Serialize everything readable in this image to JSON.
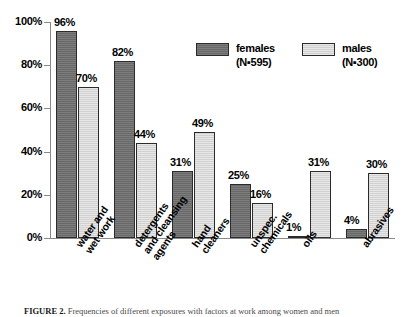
{
  "chart_data": {
    "type": "bar",
    "title": "",
    "xlabel": "",
    "ylabel": "",
    "ylim": [
      0,
      100
    ],
    "yticks": [
      0,
      20,
      40,
      60,
      80,
      100
    ],
    "ytick_labels": [
      "0%",
      "20%",
      "40%",
      "60%",
      "80%",
      "100%"
    ],
    "grid": false,
    "legend_position": "top-right",
    "categories": [
      "water and wet work",
      "detergents and cleansing agents",
      "hand cleaners",
      "unspec. chemicals",
      "oils",
      "abrasives"
    ],
    "category_lines": [
      [
        "water and",
        "wet work"
      ],
      [
        "detergents",
        "and cleansing",
        "agents"
      ],
      [
        "hand",
        "cleaners"
      ],
      [
        "unspec.",
        "chemicals"
      ],
      [
        "oils"
      ],
      [
        "abrasives"
      ]
    ],
    "series": [
      {
        "name": "females",
        "n_label": "(N=595)",
        "color": "#6e6e6e",
        "values": [
          96,
          82,
          31,
          25,
          1,
          4
        ],
        "value_labels": [
          "96%",
          "82%",
          "31%",
          "25%",
          "1%",
          "4%"
        ]
      },
      {
        "name": "males",
        "n_label": "(N=300)",
        "color": "#dadada",
        "values": [
          70,
          44,
          49,
          16,
          31,
          30
        ],
        "value_labels": [
          "70%",
          "44%",
          "49%",
          "16%",
          "31%",
          "30%"
        ]
      }
    ]
  },
  "legend": {
    "females_label": "females",
    "females_n": "(N▪595)",
    "males_label": "males",
    "males_n": "(N▪300)"
  },
  "caption": {
    "figure_number": "FIGURE 2.",
    "text": "Frequencies of different exposures with factors at work among women and men"
  }
}
